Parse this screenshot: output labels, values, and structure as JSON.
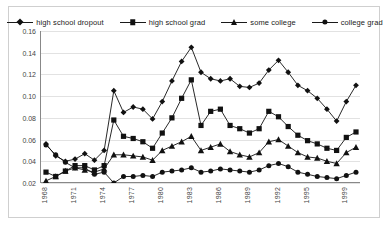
{
  "chart_data": {
    "type": "line",
    "title": "",
    "xlabel": "",
    "ylabel": "",
    "ylim": [
      0.02,
      0.16
    ],
    "ytick_values": [
      0.02,
      0.04,
      0.06,
      0.08,
      0.1,
      0.12,
      0.14,
      0.16
    ],
    "ytick_labels": [
      "0.02",
      "0.04",
      "0.06",
      "0.08",
      "0.10",
      "0.12",
      "0.14",
      "0.16"
    ],
    "grid": true,
    "legend_position": "top",
    "x": [
      1968,
      1969,
      1970,
      1971,
      1972,
      1973,
      1974,
      1975,
      1976,
      1977,
      1978,
      1979,
      1980,
      1981,
      1982,
      1983,
      1984,
      1985,
      1986,
      1987,
      1988,
      1989,
      1990,
      1991,
      1992,
      1993,
      1994,
      1995,
      1996,
      1997,
      1998,
      1999,
      2000
    ],
    "xtick_values": [
      1968,
      1971,
      1974,
      1977,
      1980,
      1983,
      1986,
      1989,
      1992,
      1995,
      1999
    ],
    "xtick_labels": [
      "1968",
      "1971",
      "1974",
      "1977",
      "1980",
      "1983",
      "1986",
      "1989",
      "1992",
      "1995",
      "1999"
    ],
    "series": [
      {
        "name": "high school dropout",
        "marker": "diamond",
        "values": [
          0.056,
          0.045,
          0.04,
          0.042,
          0.047,
          0.041,
          0.05,
          0.105,
          0.085,
          0.09,
          0.088,
          0.079,
          0.095,
          0.114,
          0.132,
          0.145,
          0.122,
          0.116,
          0.114,
          0.116,
          0.109,
          0.108,
          0.112,
          0.124,
          0.133,
          0.122,
          0.11,
          0.105,
          0.098,
          0.088,
          0.077,
          0.095,
          0.11
        ]
      },
      {
        "name": "high school grad",
        "marker": "square",
        "values": [
          0.03,
          0.026,
          0.031,
          0.036,
          0.036,
          0.032,
          0.036,
          0.078,
          0.063,
          0.061,
          0.058,
          0.052,
          0.066,
          0.08,
          0.098,
          0.115,
          0.073,
          0.086,
          0.088,
          0.073,
          0.07,
          0.066,
          0.07,
          0.086,
          0.081,
          0.072,
          0.064,
          0.059,
          0.056,
          0.052,
          0.05,
          0.062,
          0.067
        ]
      },
      {
        "name": "some college",
        "marker": "triangle",
        "values": [
          0.022,
          0.026,
          0.031,
          0.034,
          0.032,
          0.03,
          0.033,
          0.046,
          0.046,
          0.045,
          0.044,
          0.041,
          0.05,
          0.054,
          0.058,
          0.063,
          0.05,
          0.053,
          0.056,
          0.049,
          0.046,
          0.044,
          0.048,
          0.058,
          0.06,
          0.054,
          0.048,
          0.044,
          0.043,
          0.04,
          0.038,
          0.048,
          0.053
        ]
      },
      {
        "name": "college grad",
        "marker": "circle",
        "values": [
          0.055,
          0.046,
          0.039,
          0.034,
          0.034,
          0.028,
          0.03,
          0.02,
          0.026,
          0.026,
          0.027,
          0.026,
          0.03,
          0.031,
          0.032,
          0.034,
          0.03,
          0.031,
          0.033,
          0.032,
          0.031,
          0.03,
          0.032,
          0.036,
          0.038,
          0.035,
          0.03,
          0.028,
          0.026,
          0.025,
          0.024,
          0.027,
          0.03
        ]
      }
    ]
  },
  "legend": {
    "items": [
      {
        "label": "high school dropout",
        "marker": "diamond"
      },
      {
        "label": "high school grad",
        "marker": "square"
      },
      {
        "label": "some college",
        "marker": "triangle"
      },
      {
        "label": "college grad",
        "marker": "circle"
      }
    ]
  },
  "colors": {
    "series": "#111111",
    "grid": "#e2e2e2",
    "axis": "#888888",
    "border": "#cfcfcf"
  }
}
